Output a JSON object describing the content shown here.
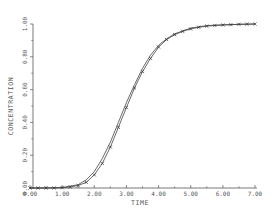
{
  "chart_data": {
    "type": "line",
    "title": "",
    "xlabel": "TIME",
    "ylabel": "CONCENTRATION",
    "xlim": [
      0,
      7
    ],
    "ylim": [
      0,
      1
    ],
    "x_ticks": [
      "0.00",
      "1.00",
      "2.00",
      "3.00",
      "4.00",
      "5.00",
      "6.00",
      "7.00"
    ],
    "y_ticks": [
      "0.00",
      "0.20",
      "0.40",
      "0.60",
      "0.80",
      "1.00"
    ],
    "grid": false,
    "legend": null,
    "series": [
      {
        "name": "model",
        "style": "line",
        "x": [
          0.0,
          0.5,
          1.0,
          1.5,
          1.75,
          2.0,
          2.25,
          2.5,
          2.75,
          3.0,
          3.25,
          3.5,
          3.75,
          4.0,
          4.25,
          4.5,
          5.0,
          5.5,
          6.0,
          6.5,
          7.0
        ],
        "values": [
          0.0,
          0.0,
          0.003,
          0.02,
          0.05,
          0.1,
          0.18,
          0.28,
          0.4,
          0.52,
          0.63,
          0.73,
          0.81,
          0.87,
          0.91,
          0.94,
          0.975,
          0.99,
          0.995,
          0.998,
          1.0
        ]
      },
      {
        "name": "data",
        "style": "line+x-markers",
        "x": [
          0.0,
          0.25,
          0.5,
          0.75,
          1.0,
          1.25,
          1.5,
          1.75,
          2.0,
          2.25,
          2.5,
          2.75,
          3.0,
          3.25,
          3.5,
          3.75,
          4.0,
          4.25,
          4.5,
          4.75,
          5.0,
          5.25,
          5.5,
          5.75,
          6.0,
          6.25,
          6.5,
          6.75,
          7.0
        ],
        "values": [
          0.0,
          0.0,
          0.0,
          0.0,
          0.002,
          0.006,
          0.015,
          0.035,
          0.08,
          0.15,
          0.25,
          0.37,
          0.49,
          0.61,
          0.71,
          0.79,
          0.86,
          0.905,
          0.935,
          0.955,
          0.97,
          0.98,
          0.987,
          0.991,
          0.994,
          0.996,
          0.998,
          0.999,
          1.0
        ]
      }
    ]
  },
  "plot": {
    "line_color": "#444444",
    "axis_color": "#555555",
    "marker_color": "#333333"
  }
}
